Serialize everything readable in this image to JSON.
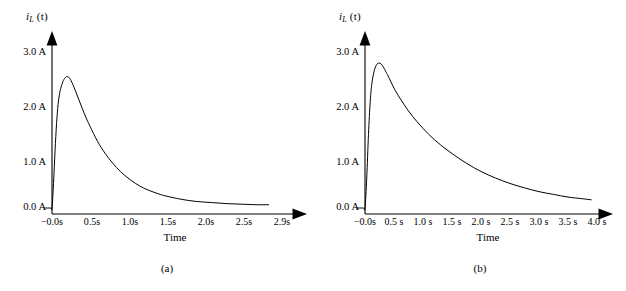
{
  "figure": {
    "background_color": "#ffffff",
    "line_color": "#000000",
    "panels": [
      {
        "id": "a",
        "caption": "(a)",
        "ylabel_main": "i",
        "ylabel_sub": "L",
        "ylabel_paren": " (t)",
        "xlabel": "Time",
        "yticks": [
          "3.0 A",
          "2.0 A",
          "1.0 A",
          "0.0 A"
        ],
        "xticks": [
          "−0.0s",
          "0.5s",
          "1.0s",
          "1.5s",
          "2.0s",
          "2.5s",
          "2.9s"
        ]
      },
      {
        "id": "b",
        "caption": "(b)",
        "ylabel_main": "i",
        "ylabel_sub": "L",
        "ylabel_paren": " (t)",
        "xlabel": "Time",
        "yticks": [
          "3.0 A",
          "2.0 A",
          "1.0 A",
          "0.0 A"
        ],
        "xticks": [
          "−0.0s",
          "0.5 s",
          "1.0 s",
          "1.5 s",
          "2.0 s",
          "2.5 s",
          "3.0 s",
          "3.5 s",
          "4.0 s"
        ]
      }
    ]
  },
  "chart_data": [
    {
      "type": "line",
      "title": "",
      "subtitle": "(a)",
      "xlabel": "Time",
      "ylabel": "i_L (t)",
      "xlim": [
        -0.1,
        2.9
      ],
      "ylim": [
        0.0,
        3.2
      ],
      "xtick_values": [
        0.0,
        0.5,
        1.0,
        1.5,
        2.0,
        2.5,
        2.9
      ],
      "xtick_labels": [
        "−0.0s",
        "0.5s",
        "1.0s",
        "1.5s",
        "2.0s",
        "2.5s",
        "2.9s"
      ],
      "ytick_values": [
        0.0,
        1.0,
        2.0,
        3.0
      ],
      "ytick_labels": [
        "0.0 A",
        "1.0 A",
        "2.0 A",
        "3.0 A"
      ],
      "grid": false,
      "legend": "none",
      "series": [
        {
          "name": "inductor current",
          "x": [
            -0.1,
            -0.02,
            0.0,
            0.02,
            0.04,
            0.06,
            0.08,
            0.1,
            0.12,
            0.15,
            0.18,
            0.2,
            0.22,
            0.25,
            0.3,
            0.35,
            0.4,
            0.45,
            0.5,
            0.6,
            0.7,
            0.8,
            0.9,
            1.0,
            1.1,
            1.2,
            1.3,
            1.4,
            1.5,
            1.7,
            1.9,
            2.1,
            2.3,
            2.5,
            2.7,
            2.85
          ],
          "y": [
            0.0,
            0.0,
            0.0,
            0.45,
            1.05,
            1.55,
            1.9,
            2.1,
            2.22,
            2.34,
            2.4,
            2.41,
            2.4,
            2.34,
            2.18,
            2.0,
            1.82,
            1.65,
            1.5,
            1.22,
            1.0,
            0.82,
            0.67,
            0.55,
            0.45,
            0.37,
            0.31,
            0.26,
            0.22,
            0.16,
            0.12,
            0.1,
            0.08,
            0.07,
            0.06,
            0.06
          ]
        }
      ]
    },
    {
      "type": "line",
      "title": "",
      "subtitle": "(b)",
      "xlabel": "Time",
      "ylabel": "i_L (t)",
      "xlim": [
        -0.15,
        4.0
      ],
      "ylim": [
        0.0,
        3.2
      ],
      "xtick_values": [
        0.0,
        0.5,
        1.0,
        1.5,
        2.0,
        2.5,
        3.0,
        3.5,
        4.0
      ],
      "xtick_labels": [
        "−0.0s",
        "0.5 s",
        "1.0 s",
        "1.5 s",
        "2.0 s",
        "2.5 s",
        "3.0 s",
        "3.5 s",
        "4.0 s"
      ],
      "ytick_values": [
        0.0,
        1.0,
        2.0,
        3.0
      ],
      "ytick_labels": [
        "0.0 A",
        "1.0 A",
        "2.0 A",
        "3.0 A"
      ],
      "grid": false,
      "legend": "none",
      "series": [
        {
          "name": "inductor current",
          "x": [
            -0.15,
            -0.03,
            0.0,
            0.03,
            0.06,
            0.09,
            0.12,
            0.16,
            0.2,
            0.24,
            0.28,
            0.32,
            0.36,
            0.4,
            0.5,
            0.6,
            0.75,
            0.9,
            1.1,
            1.3,
            1.5,
            1.75,
            2.0,
            2.25,
            2.5,
            2.75,
            3.0,
            3.25,
            3.5,
            3.75,
            3.9
          ],
          "y": [
            0.0,
            0.0,
            0.0,
            0.55,
            1.35,
            1.95,
            2.3,
            2.52,
            2.63,
            2.66,
            2.64,
            2.58,
            2.5,
            2.42,
            2.2,
            2.02,
            1.78,
            1.58,
            1.35,
            1.16,
            1.0,
            0.82,
            0.67,
            0.55,
            0.45,
            0.37,
            0.3,
            0.25,
            0.2,
            0.17,
            0.15
          ]
        }
      ]
    }
  ]
}
